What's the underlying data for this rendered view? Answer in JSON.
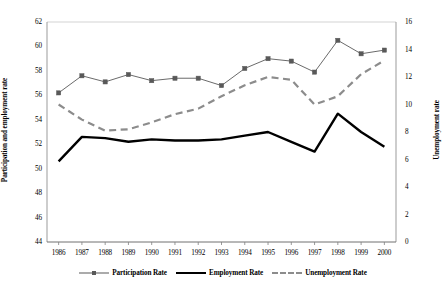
{
  "chart_data": {
    "type": "line",
    "title": "",
    "xlabel": "",
    "ylabel": "Participation and employment rate",
    "y2label": "Unemployment rate",
    "categories": [
      "1986",
      "1987",
      "1988",
      "1989",
      "1990",
      "1991",
      "1992",
      "1993",
      "1994",
      "1995",
      "1996",
      "1997",
      "1998",
      "1999",
      "2000"
    ],
    "ylim": [
      44,
      62
    ],
    "yticks": [
      44,
      46,
      48,
      50,
      52,
      54,
      56,
      58,
      60,
      62
    ],
    "y2lim": [
      0,
      16
    ],
    "y2ticks": [
      0,
      2,
      4,
      6,
      8,
      10,
      12,
      14,
      16
    ],
    "grid": false,
    "legend_position": "bottom",
    "series": [
      {
        "name": "Participation Rate",
        "axis": "left",
        "style": "line-marker",
        "color": "#595959",
        "marker": "square",
        "values": [
          56.2,
          57.6,
          57.1,
          57.7,
          57.2,
          57.4,
          57.4,
          56.8,
          58.2,
          59.0,
          58.8,
          57.9,
          60.5,
          59.4,
          59.7
        ]
      },
      {
        "name": "Employment Rate",
        "axis": "left",
        "style": "solid-thick",
        "color": "#000000",
        "marker": "none",
        "values": [
          50.6,
          52.6,
          52.5,
          52.2,
          52.4,
          52.3,
          52.3,
          52.4,
          52.7,
          53.0,
          52.2,
          51.4,
          54.5,
          53.0,
          51.8
        ]
      },
      {
        "name": "Unemployment Rate",
        "axis": "right",
        "style": "dashed",
        "color": "#8c8c8c",
        "marker": "none",
        "values": [
          10.0,
          8.9,
          8.1,
          8.2,
          8.7,
          9.3,
          9.7,
          10.6,
          11.4,
          12.0,
          11.8,
          10.0,
          10.6,
          12.2,
          13.2
        ]
      }
    ]
  },
  "axes": {
    "left_title": "Participation and employment rate",
    "right_title": "Unemployment rate"
  },
  "legend": {
    "items": [
      {
        "label": "Participation Rate",
        "key": "participation"
      },
      {
        "label": "Employment Rate",
        "key": "employment"
      },
      {
        "label": "Unemployment Rate",
        "key": "unemployment"
      }
    ]
  }
}
